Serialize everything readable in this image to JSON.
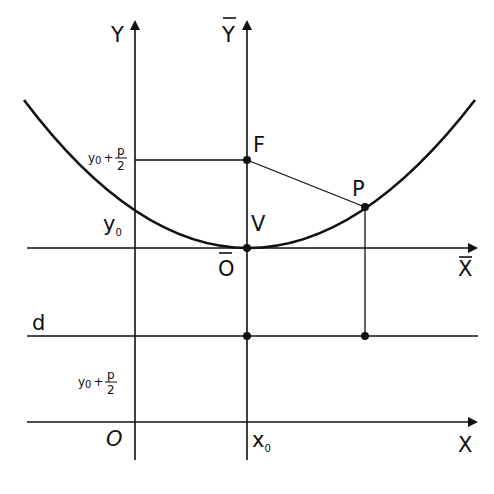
{
  "diagram": {
    "colors": {
      "stroke": "#111111",
      "background": "#ffffff"
    },
    "axes": {
      "Y": {
        "label": "Y"
      },
      "Ybar": {
        "label": "Y",
        "overbar": true
      },
      "Xbar": {
        "label": "X",
        "overbar": true
      },
      "X": {
        "label": "X"
      }
    },
    "labels": {
      "origin": "O",
      "origin_bar": "O",
      "vertex": "V",
      "focus": "F",
      "point": "P",
      "directrix": "d",
      "y0": "y",
      "y0_sub": "0",
      "x0": "x",
      "x0_sub": "0",
      "focus_level_y": "y",
      "focus_level_sub": "0",
      "focus_level_plus": "+",
      "focus_level_p": "p",
      "focus_level_2": "2",
      "directrix_level_y": "y",
      "directrix_level_sub": "0",
      "directrix_level_plus": "+",
      "directrix_level_p": "p",
      "directrix_level_2": "2"
    },
    "points": [
      {
        "name": "V",
        "x": 247,
        "y": 248
      },
      {
        "name": "F",
        "x": 247,
        "y": 160
      },
      {
        "name": "P",
        "x": 365,
        "y": 207
      },
      {
        "name": "directrix-foot-V",
        "x": 247,
        "y": 336
      },
      {
        "name": "directrix-foot-P",
        "x": 365,
        "y": 336
      }
    ]
  }
}
